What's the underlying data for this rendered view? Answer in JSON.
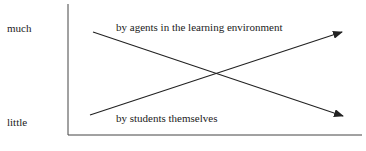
{
  "diagram": {
    "y_labels": {
      "high": "much",
      "low": "little"
    },
    "lines": [
      {
        "label": "by agents in the learning environment",
        "direction": "decreasing",
        "from": "much",
        "to": "little"
      },
      {
        "label": "by students themselves",
        "direction": "increasing",
        "from": "little",
        "to": "much"
      }
    ],
    "colors": {
      "line": "#222222",
      "background": "#ffffff"
    }
  }
}
